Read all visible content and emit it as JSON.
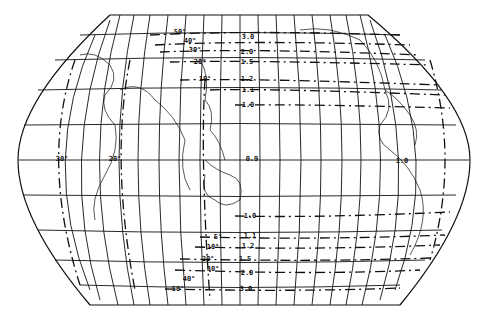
{
  "map": {
    "projection": "pseudo-cylindrical world map (Pacific-centred)",
    "colors": {
      "ink": "#111111",
      "background": "#ffffff"
    },
    "central_scale_labels": [
      {
        "text": "3.0",
        "x": 248,
        "y": 37
      },
      {
        "text": "2.0",
        "x": 247,
        "y": 52
      },
      {
        "text": "1.5",
        "x": 247,
        "y": 62
      },
      {
        "text": "1.2",
        "x": 247,
        "y": 79
      },
      {
        "text": "1.1",
        "x": 248,
        "y": 90
      },
      {
        "text": "1.0",
        "x": 248,
        "y": 105
      },
      {
        "text": "0.9",
        "x": 252,
        "y": 159
      },
      {
        "text": "1.0",
        "x": 250,
        "y": 216
      },
      {
        "text": "1.1",
        "x": 250,
        "y": 236
      },
      {
        "text": "1.2",
        "x": 248,
        "y": 246
      },
      {
        "text": "1.5",
        "x": 245,
        "y": 259
      },
      {
        "text": "2.0",
        "x": 247,
        "y": 273
      },
      {
        "text": "3.0",
        "x": 246,
        "y": 289
      }
    ],
    "angle_labels": [
      {
        "text": "50°",
        "x": 180,
        "y": 32
      },
      {
        "text": "40°",
        "x": 190,
        "y": 41
      },
      {
        "text": "30°",
        "x": 195,
        "y": 50
      },
      {
        "text": "20°",
        "x": 200,
        "y": 62
      },
      {
        "text": "10°",
        "x": 205,
        "y": 79
      },
      {
        "text": "30°",
        "x": 62,
        "y": 159
      },
      {
        "text": "20°",
        "x": 115,
        "y": 159
      },
      {
        "text": "1.0",
        "x": 402,
        "y": 161
      },
      {
        "text": "5°",
        "x": 218,
        "y": 237
      },
      {
        "text": "10°",
        "x": 213,
        "y": 247
      },
      {
        "text": "20°",
        "x": 208,
        "y": 259
      },
      {
        "text": "30°",
        "x": 213,
        "y": 269
      },
      {
        "text": "40°",
        "x": 189,
        "y": 279
      },
      {
        "text": "50°",
        "x": 178,
        "y": 289
      }
    ]
  }
}
